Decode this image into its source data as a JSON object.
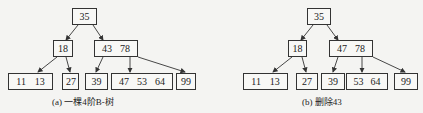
{
  "panels": [
    {
      "caption": "(a) 一棵4阶B-树",
      "nodes": [
        {
          "id": "root",
          "keys": [
            "35"
          ],
          "x": 72,
          "y": 8,
          "w": 25
        },
        {
          "id": "n18",
          "keys": [
            "18"
          ],
          "x": 53,
          "y": 40,
          "w": 20
        },
        {
          "id": "n43_78",
          "keys": [
            "43",
            "78"
          ],
          "x": 94,
          "y": 40,
          "w": 44
        },
        {
          "id": "n11_13",
          "keys": [
            "11",
            "13"
          ],
          "x": 8,
          "y": 73,
          "w": 45
        },
        {
          "id": "n27",
          "keys": [
            "27"
          ],
          "x": 62,
          "y": 73,
          "w": 17
        },
        {
          "id": "n39",
          "keys": [
            "39"
          ],
          "x": 85,
          "y": 73,
          "w": 23
        },
        {
          "id": "n47_53_64",
          "keys": [
            "47",
            "53",
            "64"
          ],
          "x": 111,
          "y": 73,
          "w": 62
        },
        {
          "id": "n99",
          "keys": [
            "99"
          ],
          "x": 176,
          "y": 73,
          "w": 20
        }
      ]
    },
    {
      "caption": "(b) 删除43",
      "nodes": [
        {
          "id": "root",
          "keys": [
            "35"
          ],
          "x": 307,
          "y": 8,
          "w": 24
        },
        {
          "id": "n18",
          "keys": [
            "18"
          ],
          "x": 288,
          "y": 40,
          "w": 19
        },
        {
          "id": "n47_78",
          "keys": [
            "47",
            "78"
          ],
          "x": 329,
          "y": 40,
          "w": 44
        },
        {
          "id": "n11_13",
          "keys": [
            "11",
            "13"
          ],
          "x": 243,
          "y": 73,
          "w": 45
        },
        {
          "id": "n27",
          "keys": [
            "27"
          ],
          "x": 296,
          "y": 73,
          "w": 22
        },
        {
          "id": "n39",
          "keys": [
            "39"
          ],
          "x": 321,
          "y": 73,
          "w": 24
        },
        {
          "id": "n53_64",
          "keys": [
            "53",
            "64"
          ],
          "x": 346,
          "y": 73,
          "w": 42
        },
        {
          "id": "n99",
          "keys": [
            "99"
          ],
          "x": 394,
          "y": 73,
          "w": 24
        }
      ]
    }
  ]
}
